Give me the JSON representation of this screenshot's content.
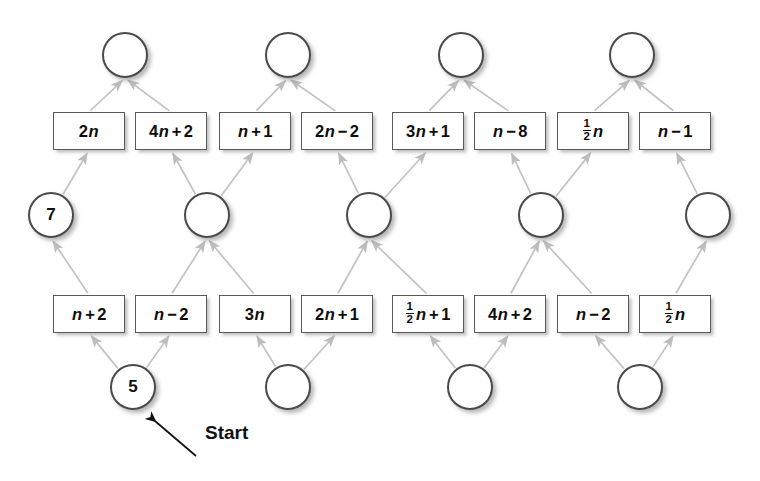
{
  "diagram": {
    "start_label": "Start",
    "colors": {
      "background": "#ffffff",
      "circle_stroke": "#4a4a4a",
      "box_stroke": "#5a5a5a",
      "arrow": "#bdbdbd",
      "text": "#0d0d0d",
      "shadow": "#888888"
    },
    "rows": {
      "top_circles": {
        "name": "top-circle-row",
        "count": 4,
        "values": [
          "",
          "",
          "",
          ""
        ],
        "positions": [
          {
            "cx": 125,
            "cy": 55
          },
          {
            "cx": 288,
            "cy": 55
          },
          {
            "cx": 461,
            "cy": 55
          },
          {
            "cx": 632,
            "cy": 55
          }
        ]
      },
      "top_boxes": {
        "name": "top-box-row",
        "count": 8,
        "labels": [
          "2n",
          "4n + 2",
          "n + 1",
          "2n − 2",
          "3n + 1",
          "n − 8",
          "½n",
          "n − 1"
        ],
        "positions": [
          {
            "x": 53,
            "y": 112
          },
          {
            "x": 135,
            "y": 112
          },
          {
            "x": 219,
            "y": 112
          },
          {
            "x": 301,
            "y": 112
          },
          {
            "x": 392,
            "y": 112
          },
          {
            "x": 474,
            "y": 112
          },
          {
            "x": 557,
            "y": 112
          },
          {
            "x": 639,
            "y": 112
          }
        ]
      },
      "middle_circles": {
        "name": "middle-circle-row",
        "count": 5,
        "values": [
          "7",
          "",
          "",
          "",
          ""
        ],
        "positions": [
          {
            "cx": 51,
            "cy": 215
          },
          {
            "cx": 207,
            "cy": 215
          },
          {
            "cx": 369,
            "cy": 215
          },
          {
            "cx": 541,
            "cy": 215
          },
          {
            "cx": 708,
            "cy": 215
          }
        ]
      },
      "bottom_boxes": {
        "name": "bottom-box-row",
        "count": 8,
        "labels": [
          "n + 2",
          "n − 2",
          "3n",
          "2n + 1",
          "½n + 1",
          "4n + 2",
          "n − 2",
          "½n"
        ],
        "positions": [
          {
            "x": 53,
            "y": 295
          },
          {
            "x": 135,
            "y": 295
          },
          {
            "x": 219,
            "y": 295
          },
          {
            "x": 301,
            "y": 295
          },
          {
            "x": 392,
            "y": 295
          },
          {
            "x": 474,
            "y": 295
          },
          {
            "x": 557,
            "y": 295
          },
          {
            "x": 639,
            "y": 295
          }
        ]
      },
      "bottom_circles": {
        "name": "bottom-circle-row",
        "count": 4,
        "values": [
          "5",
          "",
          "",
          ""
        ],
        "positions": [
          {
            "cx": 133,
            "cy": 387
          },
          {
            "cx": 288,
            "cy": 387
          },
          {
            "cx": 470,
            "cy": 387
          },
          {
            "cx": 640,
            "cy": 387
          }
        ]
      }
    },
    "start_annotation": {
      "label": "Start",
      "label_x": 205,
      "label_y": 432,
      "arrow_tail_x": 196,
      "arrow_tail_y": 456,
      "arrow_head_x": 152,
      "arrow_head_y": 418
    },
    "edges": {
      "description": "Light gray arrows; each middle circle feeds two boxes above it and receives from two boxes below it.",
      "bottom_circle_to_bottom_box": [
        {
          "from": 0,
          "to": 0
        },
        {
          "from": 0,
          "to": 1
        },
        {
          "from": 1,
          "to": 2
        },
        {
          "from": 1,
          "to": 3
        },
        {
          "from": 2,
          "to": 4
        },
        {
          "from": 2,
          "to": 5
        },
        {
          "from": 3,
          "to": 6
        },
        {
          "from": 3,
          "to": 7
        }
      ],
      "bottom_box_to_middle_circle": [
        {
          "from": 0,
          "to": 0
        },
        {
          "from": 1,
          "to": 1
        },
        {
          "from": 2,
          "to": 1
        },
        {
          "from": 3,
          "to": 2
        },
        {
          "from": 4,
          "to": 2
        },
        {
          "from": 5,
          "to": 3
        },
        {
          "from": 6,
          "to": 3
        },
        {
          "from": 7,
          "to": 4
        }
      ],
      "middle_circle_to_top_box": [
        {
          "from": 0,
          "to": 0
        },
        {
          "from": 1,
          "to": 1
        },
        {
          "from": 1,
          "to": 2
        },
        {
          "from": 2,
          "to": 3
        },
        {
          "from": 2,
          "to": 4
        },
        {
          "from": 3,
          "to": 5
        },
        {
          "from": 3,
          "to": 6
        },
        {
          "from": 4,
          "to": 7
        }
      ],
      "top_box_to_top_circle": [
        {
          "from": 0,
          "to": 0
        },
        {
          "from": 1,
          "to": 0
        },
        {
          "from": 2,
          "to": 1
        },
        {
          "from": 3,
          "to": 1
        },
        {
          "from": 4,
          "to": 2
        },
        {
          "from": 5,
          "to": 2
        },
        {
          "from": 6,
          "to": 3
        },
        {
          "from": 7,
          "to": 3
        }
      ]
    }
  }
}
